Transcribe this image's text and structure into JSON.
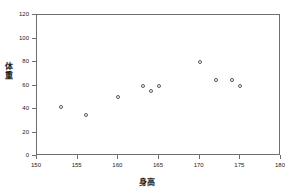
{
  "chart_data": {
    "type": "scatter",
    "title": "",
    "xlabel": "身高",
    "ylabel": "体重",
    "xlim": [
      150,
      180
    ],
    "ylim": [
      0,
      120
    ],
    "xticks": [
      "150",
      "155",
      "160",
      "165",
      "170",
      "175",
      "180"
    ],
    "yticks": [
      "0",
      "20",
      "40",
      "60",
      "80",
      "100",
      "120"
    ],
    "grid": false,
    "legend": "none",
    "marker": "open-circle",
    "marker_color": "#555a63",
    "frame_color": "#6f6f6f",
    "points": [
      {
        "x": 153,
        "y": 42
      },
      {
        "x": 156,
        "y": 35
      },
      {
        "x": 160,
        "y": 50
      },
      {
        "x": 163,
        "y": 60
      },
      {
        "x": 164,
        "y": 55
      },
      {
        "x": 165,
        "y": 60
      },
      {
        "x": 170,
        "y": 80
      },
      {
        "x": 172,
        "y": 65
      },
      {
        "x": 174,
        "y": 65
      },
      {
        "x": 175,
        "y": 60
      }
    ]
  }
}
